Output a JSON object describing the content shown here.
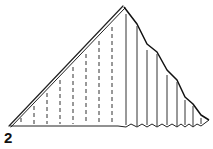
{
  "diagram": {
    "kind": "folding-instruction",
    "step_number": "2",
    "colors": {
      "stroke": "#222222",
      "background": "#ffffff"
    },
    "shape": {
      "apex": [
        124,
        7
      ],
      "left_corner": [
        10,
        126
      ],
      "right_end": [
        209,
        120
      ]
    },
    "dashed_fold_lines_x": [
      21,
      34,
      47,
      60,
      73,
      86,
      99,
      112
    ],
    "solid_fold_lines_x": [
      126,
      137,
      147,
      157,
      167,
      177,
      185,
      193,
      201
    ]
  }
}
